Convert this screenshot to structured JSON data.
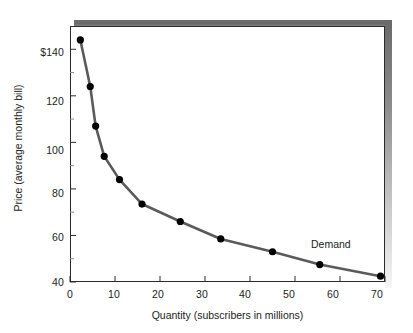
{
  "chart_data": {
    "type": "line",
    "title": "",
    "subtitle": "",
    "xlabel": "Quantity (subscribers in millions)",
    "ylabel": "Price (average monthly bill)",
    "xlim": [
      0,
      70
    ],
    "ylim": [
      40,
      150
    ],
    "grid": false,
    "legend_position": "none",
    "series": [
      {
        "name": "Demand",
        "x": [
          2.3,
          4.5,
          5.7,
          7.6,
          11.0,
          16.0,
          24.5,
          33.5,
          45.0,
          55.5,
          69.0
        ],
        "values": [
          144,
          124,
          107,
          94,
          84,
          73.5,
          66,
          58.5,
          53,
          47.5,
          42.5
        ],
        "line_color": "#5b5b5b",
        "marker_color": "#000000",
        "marker": "circle"
      }
    ],
    "x_ticks": [
      0,
      10,
      20,
      30,
      40,
      50,
      60,
      70
    ],
    "x_tick_labels": [
      "0",
      "10",
      "20",
      "30",
      "40",
      "50",
      "60",
      "70"
    ],
    "y_ticks": [
      40,
      50,
      60,
      70,
      80,
      90,
      100,
      110,
      120,
      130,
      140
    ],
    "y_major_ticks": [
      40,
      60,
      80,
      100,
      120,
      140
    ],
    "y_tick_labels": [
      "40",
      "60",
      "80",
      "100",
      "120",
      "$140"
    ],
    "annotations": [
      {
        "text": "Demand",
        "x": 56,
        "y": 55
      }
    ]
  },
  "axes": {
    "x_title": "Quantity (subscribers in millions)",
    "y_title": "Price (average monthly bill)",
    "x_labels": [
      "0",
      "10",
      "20",
      "30",
      "40",
      "50",
      "60",
      "70"
    ],
    "y_labels": [
      "$140",
      "120",
      "100",
      "80",
      "60",
      "40"
    ]
  },
  "annotations": {
    "demand": "Demand"
  },
  "colors": {
    "line": "#5b5b5b",
    "marker": "#000000",
    "frame": "#2b2b2b",
    "shadow_dark": "#6a6a6a",
    "background": "#ffffff",
    "text": "#1d1d1d"
  }
}
